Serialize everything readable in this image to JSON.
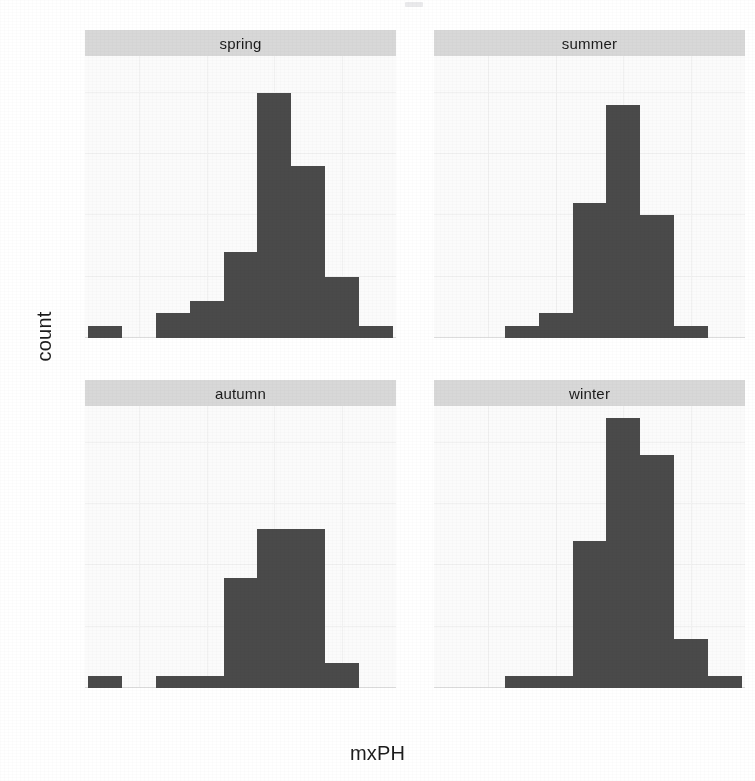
{
  "chart_data": {
    "type": "bar",
    "title": "",
    "subtitle": "",
    "xlabel": "mxPH",
    "ylabel": "count",
    "xlim": [
      5.2,
      9.8
    ],
    "ylim": [
      0,
      23
    ],
    "grid": true,
    "legend": "none",
    "facet_layout": "2x2",
    "binwidth": 0.5,
    "xticks": [
      6,
      7,
      8,
      9
    ],
    "xticklabels": [
      "6",
      "7",
      "8",
      "9"
    ],
    "yticks": [
      0,
      5,
      10,
      15,
      20
    ],
    "yticklabels": [
      "0",
      "5",
      "10",
      "15",
      "20"
    ],
    "facets": [
      {
        "label": "spring",
        "bins": [
          {
            "x0": 5.25,
            "x1": 5.75,
            "count": 1
          },
          {
            "x0": 5.75,
            "x1": 6.25,
            "count": 0
          },
          {
            "x0": 6.25,
            "x1": 6.75,
            "count": 2
          },
          {
            "x0": 6.75,
            "x1": 7.25,
            "count": 3
          },
          {
            "x0": 7.25,
            "x1": 7.75,
            "count": 7
          },
          {
            "x0": 7.75,
            "x1": 8.25,
            "count": 20
          },
          {
            "x0": 8.25,
            "x1": 8.75,
            "count": 14
          },
          {
            "x0": 8.75,
            "x1": 9.25,
            "count": 5
          },
          {
            "x0": 9.25,
            "x1": 9.75,
            "count": 1
          }
        ]
      },
      {
        "label": "summer",
        "bins": [
          {
            "x0": 6.25,
            "x1": 6.75,
            "count": 1
          },
          {
            "x0": 6.75,
            "x1": 7.25,
            "count": 2
          },
          {
            "x0": 7.25,
            "x1": 7.75,
            "count": 11
          },
          {
            "x0": 7.75,
            "x1": 8.25,
            "count": 19
          },
          {
            "x0": 8.25,
            "x1": 8.75,
            "count": 10
          },
          {
            "x0": 8.75,
            "x1": 9.25,
            "count": 1
          }
        ]
      },
      {
        "label": "autumn",
        "bins": [
          {
            "x0": 5.25,
            "x1": 5.75,
            "count": 1
          },
          {
            "x0": 5.75,
            "x1": 6.25,
            "count": 0
          },
          {
            "x0": 6.25,
            "x1": 6.75,
            "count": 1
          },
          {
            "x0": 6.75,
            "x1": 7.25,
            "count": 1
          },
          {
            "x0": 7.25,
            "x1": 7.75,
            "count": 9
          },
          {
            "x0": 7.75,
            "x1": 8.75,
            "count": 13
          },
          {
            "x0": 8.75,
            "x1": 9.25,
            "count": 2
          }
        ]
      },
      {
        "label": "winter",
        "bins": [
          {
            "x0": 6.25,
            "x1": 7.25,
            "count": 1
          },
          {
            "x0": 7.25,
            "x1": 7.75,
            "count": 12
          },
          {
            "x0": 7.75,
            "x1": 8.25,
            "count": 22
          },
          {
            "x0": 8.25,
            "x1": 8.75,
            "count": 19
          },
          {
            "x0": 8.75,
            "x1": 9.25,
            "count": 4
          },
          {
            "x0": 9.25,
            "x1": 9.75,
            "count": 1
          }
        ]
      }
    ],
    "colors": {
      "bar_fill": "#4a4a4a",
      "panel_background": "#fbfbfb",
      "strip_background": "#d8d8d8",
      "figure_background": "#ffffff",
      "text": "#1c1c1c"
    }
  }
}
